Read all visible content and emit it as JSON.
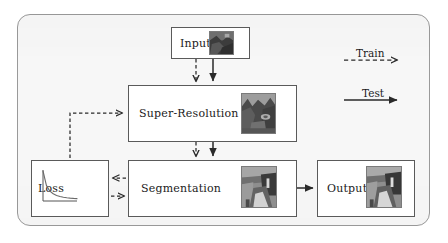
{
  "figure": {
    "type": "flow-diagram",
    "background_color": "#f7f7f7",
    "frame_border_color": "#9a9a9a",
    "box_border_color": "#5a5a5a",
    "text_color": "#1b1b1b"
  },
  "nodes": {
    "input": {
      "label": "Input",
      "thumbnail": "low-resolution-street-scene-thumbnail"
    },
    "super_resolution": {
      "label": "Super-Resolution",
      "thumbnail": "super-resolved-street-scene-thumbnail"
    },
    "segmentation": {
      "label": "Segmentation",
      "thumbnail": "segmentation-map-thumbnail"
    },
    "loss": {
      "label": "Loss",
      "thumbnail": "loss-decay-curve-plot"
    },
    "output": {
      "label": "Output",
      "thumbnail": "output-segmentation-thumbnail"
    }
  },
  "legend": {
    "train": {
      "label": "Train",
      "style": "dashed",
      "arrow": "right"
    },
    "test": {
      "label": "Test",
      "style": "solid",
      "arrow": "right"
    }
  },
  "edges": [
    {
      "from": "input",
      "to": "super_resolution",
      "style": "dashed",
      "name": "input-to-sr-train"
    },
    {
      "from": "input",
      "to": "super_resolution",
      "style": "solid",
      "name": "input-to-sr-test"
    },
    {
      "from": "super_resolution",
      "to": "segmentation",
      "style": "dashed",
      "name": "sr-to-seg-train"
    },
    {
      "from": "super_resolution",
      "to": "segmentation",
      "style": "solid",
      "name": "sr-to-seg-test"
    },
    {
      "from": "segmentation",
      "to": "loss",
      "style": "dashed",
      "name": "seg-to-loss-train"
    },
    {
      "from": "loss",
      "to": "segmentation",
      "style": "dashed",
      "name": "loss-to-seg-train"
    },
    {
      "from": "loss",
      "to": "super_resolution",
      "style": "dashed",
      "name": "loss-to-sr-train"
    },
    {
      "from": "segmentation",
      "to": "output",
      "style": "solid",
      "name": "seg-to-output-test"
    }
  ],
  "chart_data": {
    "type": "line",
    "title": "Loss",
    "xlabel": "",
    "ylabel": "",
    "x": [
      0,
      1,
      2,
      3,
      4,
      5,
      6,
      7,
      8,
      9,
      10
    ],
    "values": [
      1.0,
      0.52,
      0.33,
      0.24,
      0.185,
      0.15,
      0.125,
      0.108,
      0.095,
      0.086,
      0.08
    ],
    "xlim": [
      0,
      10
    ],
    "ylim": [
      0,
      1
    ],
    "grid": false,
    "legend": "none"
  }
}
